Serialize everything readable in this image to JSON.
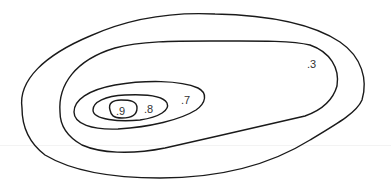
{
  "diagram": {
    "type": "contour-plot",
    "stroke_color": "#1a1a1a",
    "contours": [
      {
        "id": "outer",
        "label": ""
      },
      {
        "id": "level-3",
        "label": ".3"
      },
      {
        "id": "level-7",
        "label": ".7"
      },
      {
        "id": "level-8",
        "label": ".8"
      },
      {
        "id": "level-9",
        "label": ".9"
      }
    ]
  }
}
